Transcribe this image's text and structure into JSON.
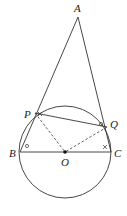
{
  "diagram": {
    "type": "geometry",
    "stroke_color": "#333333",
    "points": {
      "A": {
        "label": "A",
        "x": 78,
        "y": 17
      },
      "B": {
        "label": "B",
        "x": 20,
        "y": 152
      },
      "C": {
        "label": "C",
        "x": 111,
        "y": 152
      },
      "O": {
        "label": "O",
        "x": 65,
        "y": 152
      },
      "P": {
        "label": "P",
        "x": 35,
        "y": 113
      },
      "Q": {
        "label": "Q",
        "x": 107,
        "y": 127
      }
    },
    "circle": {
      "center": "O",
      "cx": 65,
      "cy": 152,
      "r": 46
    },
    "segments_solid": [
      "AB",
      "AC",
      "BC",
      "PQ"
    ],
    "segments_dashed": [
      "OP",
      "OQ"
    ],
    "angle_marks": [
      {
        "at": "B",
        "symbol": "circle"
      },
      {
        "at": "Q",
        "symbol": "circle"
      },
      {
        "at": "P",
        "symbol": "cross"
      },
      {
        "at": "C",
        "symbol": "cross"
      }
    ]
  }
}
